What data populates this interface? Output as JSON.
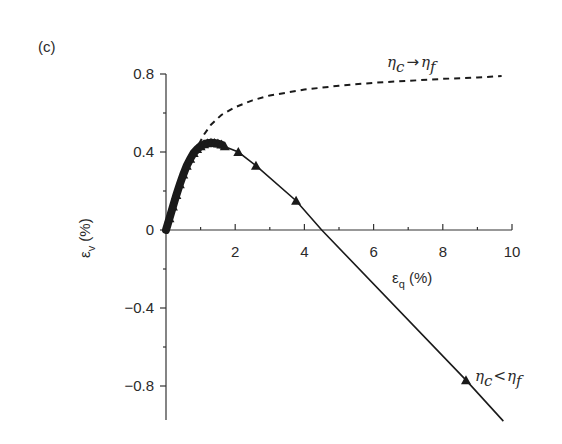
{
  "panel_label": "(c)",
  "chart_data": {
    "type": "line",
    "title": "",
    "xlabel": "εq (%)",
    "ylabel": "εv (%)",
    "xlim": [
      0,
      10
    ],
    "ylim": [
      -1.0,
      0.8
    ],
    "x_ticks": [
      0,
      2,
      4,
      6,
      8,
      10
    ],
    "x_tick_labels": [
      "",
      "2",
      "4",
      "6",
      "8",
      "10"
    ],
    "x_minor_ticks": [
      1,
      3,
      5,
      7,
      9
    ],
    "y_ticks": [
      0.8,
      0.4,
      0,
      -0.4,
      -0.8
    ],
    "y_tick_labels": [
      "0.8",
      "0.4",
      "0",
      "−0.4",
      "−0.8"
    ],
    "y_minor_ticks": [
      0.6,
      0.2,
      -0.2,
      -0.6
    ],
    "grid": false,
    "legend": null,
    "series": [
      {
        "name": "ηc < ηf",
        "style": "solid line with triangle markers",
        "color": "#1a1a1a",
        "x": [
          0.0,
          0.1,
          0.2,
          0.3,
          0.4,
          0.5,
          0.6,
          0.7,
          0.8,
          0.9,
          1.0,
          1.1,
          1.2,
          1.3,
          1.4,
          1.5,
          1.6,
          1.7,
          1.8,
          2.09,
          2.6,
          3.76,
          4.5,
          8.67,
          9.75
        ],
        "y": [
          0.0,
          0.06,
          0.12,
          0.18,
          0.235,
          0.285,
          0.33,
          0.365,
          0.395,
          0.415,
          0.43,
          0.44,
          0.445,
          0.447,
          0.446,
          0.443,
          0.438,
          0.43,
          0.42,
          0.4,
          0.33,
          0.15,
          0.0,
          -0.77,
          -0.98
        ],
        "marker_points": [
          {
            "x": 0.1,
            "y": 0.06
          },
          {
            "x": 0.2,
            "y": 0.12
          },
          {
            "x": 0.3,
            "y": 0.18
          },
          {
            "x": 0.4,
            "y": 0.235
          },
          {
            "x": 0.5,
            "y": 0.285
          },
          {
            "x": 0.6,
            "y": 0.33
          },
          {
            "x": 0.7,
            "y": 0.365
          },
          {
            "x": 0.8,
            "y": 0.395
          },
          {
            "x": 0.9,
            "y": 0.415
          },
          {
            "x": 1.0,
            "y": 0.43
          },
          {
            "x": 1.1,
            "y": 0.44
          },
          {
            "x": 1.2,
            "y": 0.445
          },
          {
            "x": 1.3,
            "y": 0.447
          },
          {
            "x": 1.4,
            "y": 0.446
          },
          {
            "x": 1.5,
            "y": 0.443
          },
          {
            "x": 1.6,
            "y": 0.438
          },
          {
            "x": 1.7,
            "y": 0.43
          },
          {
            "x": 2.09,
            "y": 0.4
          },
          {
            "x": 2.6,
            "y": 0.33
          },
          {
            "x": 3.76,
            "y": 0.15
          },
          {
            "x": 8.67,
            "y": -0.77
          }
        ]
      },
      {
        "name": "ηc → ηf",
        "style": "dashed line",
        "color": "#1a1a1a",
        "x": [
          0.95,
          1.1,
          1.3,
          1.6,
          2.0,
          2.5,
          3.0,
          4.0,
          5.0,
          6.0,
          7.0,
          8.0,
          9.0,
          9.7
        ],
        "y": [
          0.44,
          0.49,
          0.54,
          0.59,
          0.63,
          0.665,
          0.69,
          0.72,
          0.74,
          0.755,
          0.765,
          0.775,
          0.782,
          0.79
        ]
      }
    ],
    "annotations": [
      {
        "text": "ηc → ηf",
        "x": 7.3,
        "y": 0.86
      },
      {
        "text": "ηc < ηf",
        "x": 8.9,
        "y": -0.75
      }
    ]
  },
  "annotations": {
    "upper": {
      "a": "η",
      "a_sub": "c",
      "op": "→",
      "b": "η",
      "b_sub": "f"
    },
    "lower": {
      "a": "η",
      "a_sub": "c",
      "op": "<",
      "b": "η",
      "b_sub": "f"
    }
  },
  "axes": {
    "x_title_main": "ε",
    "x_title_sub": "q",
    "x_title_unit": " (%)",
    "y_title_main": "ε",
    "y_title_sub": "v",
    "y_title_unit": " (%)"
  }
}
